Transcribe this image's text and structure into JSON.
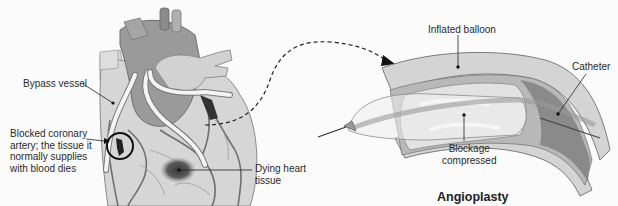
{
  "figure": {
    "left_panel": {
      "subject": "Heart with coronary bypass",
      "labels": {
        "bypass_vessel": "Bypass vessel",
        "blocked_artery": "Blocked coronary\nartery; the tissue it\nnormally supplies\nwith blood dies",
        "dying_tissue": "Dying heart\ntissue"
      }
    },
    "right_panel": {
      "title": "Angioplasty",
      "labels": {
        "inflated_balloon": "Inflated balloon",
        "catheter": "Catheter",
        "blockage_compressed": "Blockage\ncompressed"
      }
    },
    "connector": "dashed-arrow-from-heart-to-artery-detail",
    "colors": {
      "heart_tissue": "#c8c8c8",
      "heart_dark": "#8f8f8f",
      "vessel_dark": "#6a6a6a",
      "bypass_vessel": "#f2f2f2",
      "dying_tissue": "#4a4a4a",
      "artery_wall": "#9a9a9a",
      "balloon": "#e4e4e4",
      "label_text": "#2a2a2a",
      "background": "#fbfbfb"
    }
  }
}
